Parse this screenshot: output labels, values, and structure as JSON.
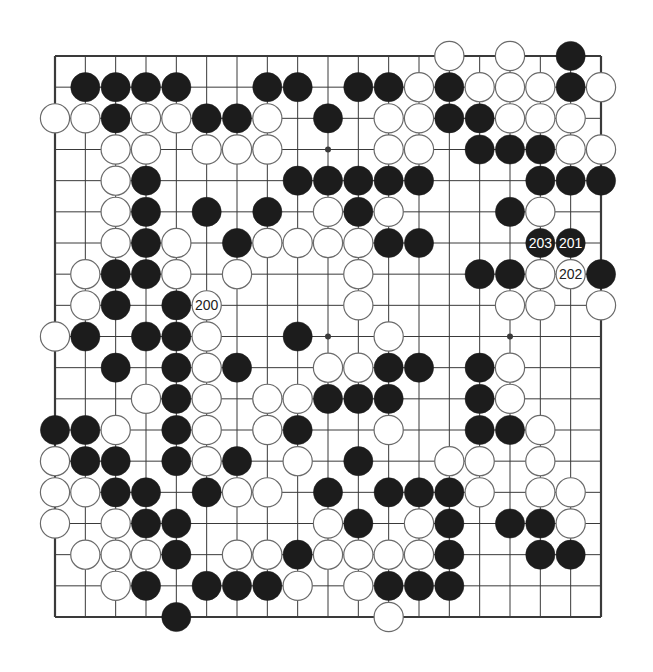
{
  "diagram": {
    "title": "Go board diagram (moves 200-203)",
    "board_size": 19,
    "colors": {
      "background": "#ffffff",
      "line": "#3a3a3a",
      "black_stone": "#1c1c1c",
      "white_stone": "#ffffff",
      "white_stone_border": "#6a6a6a",
      "label_on_black": "#ffffff",
      "label_on_white": "#222222"
    },
    "rows": [
      ".............W.W.B.",
      ".BBBB..BB.BBWBWWWBW",
      "WWBWWBBW.B.WWBBWWW.",
      "..WW.WWW...WW.BBBWW",
      "..WB....BBBBB...BBB",
      "..WB.B.B.WBW...BW..",
      "..WBW.BWWWWBB...BB.",
      ".WBBW.W...W...BBWWB",
      ".WB.BW....W....WW.W",
      "WB.BBW..B..W.......",
      "..B.BWB..WWBB.BW...",
      "...WBW.WWBBB..BW...",
      "BBW.BW.WB..W..BBW..",
      "WBB.BWB.W.B..WW.W..",
      "WWBB.BWW.B.BBBW.WW.",
      "W.WBB....WB.WB.BBW.",
      ".WWWB.WWBWWWWB..BB.",
      "..WB.BBBW.WBBB.....",
      "....B......W......."
    ],
    "star_points": [
      [
        3,
        9
      ],
      [
        9,
        9
      ],
      [
        9,
        15
      ]
    ],
    "labels": [
      {
        "row": 8,
        "col": 5,
        "text": "200",
        "color": "white"
      },
      {
        "row": 6,
        "col": 17,
        "text": "201",
        "color": "black"
      },
      {
        "row": 7,
        "col": 17,
        "text": "202",
        "color": "white"
      },
      {
        "row": 6,
        "col": 16,
        "text": "203",
        "color": "black"
      }
    ],
    "move_labels_text": [
      "200",
      "201",
      "202",
      "203"
    ]
  }
}
